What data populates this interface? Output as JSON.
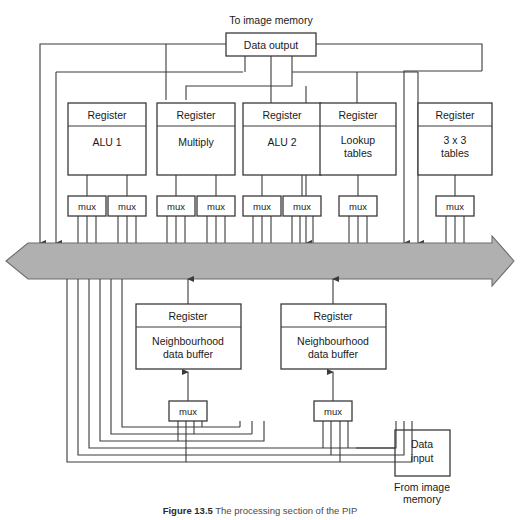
{
  "figure": {
    "top_annotation": "To image memory",
    "bottom_annotation_line1": "From image",
    "bottom_annotation_line2": "memory",
    "caption_label": "Figure 13.5",
    "caption_text": "The processing section of the PIP",
    "bus_color": "#b0b0b0",
    "line_color": "#3a3a3a"
  },
  "data_output": {
    "label": "Data output"
  },
  "data_input": {
    "line1": "Data",
    "line2": "input"
  },
  "register_label": "Register",
  "top_units": [
    {
      "register": "Register",
      "name": "ALU 1",
      "name_line2": "",
      "mux_count": 2
    },
    {
      "register": "Register",
      "name": "Multiply",
      "name_line2": "",
      "mux_count": 2
    },
    {
      "register": "Register",
      "name": "ALU 2",
      "name_line2": "",
      "mux_count": 2
    },
    {
      "register": "Register",
      "name": "Lookup",
      "name_line2": "tables",
      "mux_count": 1
    },
    {
      "register": "Register",
      "name": "3 x 3",
      "name_line2": "tables",
      "mux_count": 1
    }
  ],
  "bottom_units": [
    {
      "register": "Register",
      "name": "Neighbourhood",
      "name_line2": "data buffer",
      "mux": "mux"
    },
    {
      "register": "Register",
      "name": "Neighbourhood",
      "name_line2": "data buffer",
      "mux": "mux"
    }
  ],
  "mux_label": "mux",
  "muxes": [
    {
      "id": "mux-alu1-a"
    },
    {
      "id": "mux-alu1-b"
    },
    {
      "id": "mux-multiply-a"
    },
    {
      "id": "mux-multiply-b"
    },
    {
      "id": "mux-alu2-a"
    },
    {
      "id": "mux-alu2-b"
    },
    {
      "id": "mux-lookup"
    },
    {
      "id": "mux-3x3"
    },
    {
      "id": "mux-ndb-left"
    },
    {
      "id": "mux-ndb-right"
    }
  ]
}
